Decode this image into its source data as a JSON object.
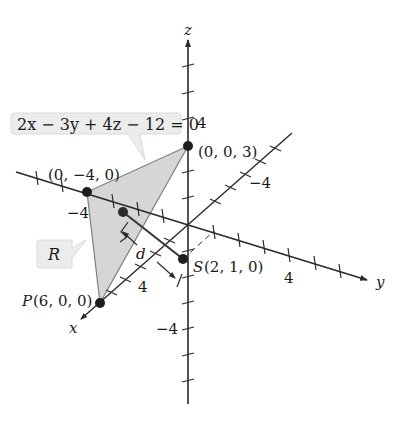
{
  "figure": {
    "plane_equation": "2x − 3y + 4z − 12 = 0",
    "region_label": "R",
    "axes": {
      "x": "x",
      "y": "y",
      "z": "z"
    },
    "points": {
      "z_intercept": "(0, 0, 3)",
      "y_intercept": "(0, −4, 0)",
      "P_name": "P",
      "P_coords": "(6, 0, 0)",
      "S_name": "S",
      "S_coords": "(2, 1, 0)"
    },
    "distance_label": "d",
    "tick_labels": {
      "z_pos": "4",
      "z_neg": "−4",
      "y_pos": "4",
      "y_neg": "−4",
      "x_pos": "4",
      "x_neg": "−4"
    }
  },
  "colors": {
    "axis": "#2a2a2a",
    "plane_fill": "#d6d6d6",
    "plane_edge": "#808080",
    "callout_fill": "#ececec",
    "point": "#1e1e1e"
  }
}
